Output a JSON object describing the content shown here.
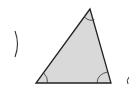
{
  "figure": {
    "type": "triangle",
    "vertices": {
      "apex": [
        90,
        9
      ],
      "bottom_left": [
        36,
        83
      ],
      "bottom_right": [
        111,
        83
      ]
    },
    "fill": "#d9d9d9",
    "stroke": "#222222",
    "angle_marks": [
      "apex",
      "bottom_left",
      "bottom_right"
    ]
  },
  "labels": {
    "left_paren": ")",
    "right_partial": "("
  }
}
